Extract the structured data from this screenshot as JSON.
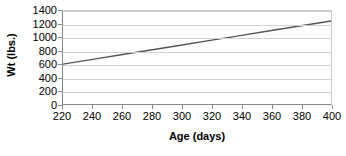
{
  "chart_data": {
    "type": "line",
    "title": "",
    "xlabel": "Age (days)",
    "ylabel": "Wt (lbs.)",
    "xlim": [
      220,
      400
    ],
    "ylim": [
      0,
      1400
    ],
    "xticks": [
      220,
      240,
      260,
      280,
      300,
      320,
      340,
      360,
      380,
      400
    ],
    "yticks": [
      0,
      200,
      400,
      600,
      800,
      1000,
      1200,
      1400
    ],
    "grid": "horizontal",
    "legend": "none",
    "series": [
      {
        "name": "Weight",
        "color": "#555555",
        "x": [
          220,
          240,
          260,
          280,
          300,
          320,
          340,
          360,
          380,
          400
        ],
        "values": [
          600,
          672,
          745,
          817,
          889,
          961,
          1033,
          1106,
          1178,
          1250
        ]
      }
    ]
  },
  "axes": {
    "y_title": "Wt (lbs.)",
    "x_title": "Age (days)",
    "y_labels": [
      "1400",
      "1200",
      "1000",
      "800",
      "600",
      "400",
      "200",
      "0"
    ],
    "x_labels": [
      "220",
      "240",
      "260",
      "280",
      "300",
      "320",
      "340",
      "360",
      "380",
      "400"
    ]
  },
  "colors": {
    "line": "#555555",
    "gridline": "#d2d2d2",
    "axis": "#8a8a8a",
    "text": "#000000",
    "background": "#ffffff"
  }
}
